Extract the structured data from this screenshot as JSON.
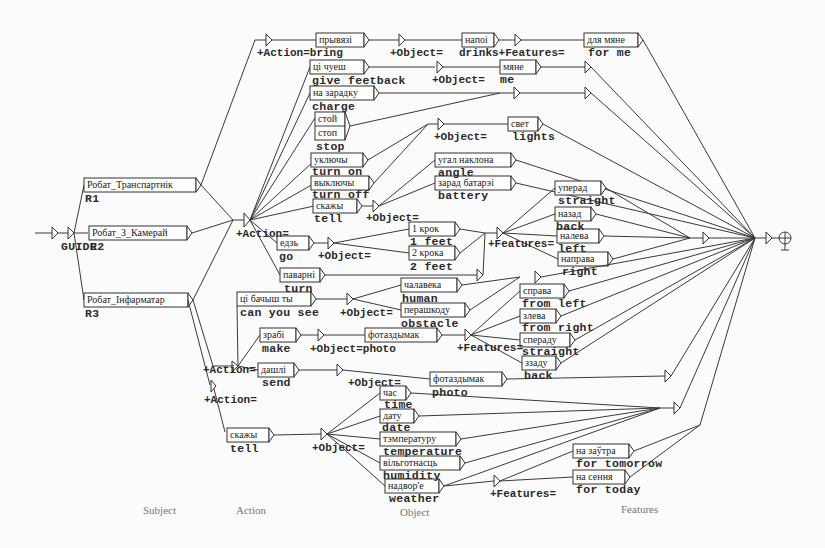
{
  "diagram": {
    "title": "",
    "start_label": "GUIDE",
    "columns": [
      "Subject",
      "Action",
      "Object",
      "Features"
    ],
    "subjects": [
      {
        "input": "Робат_Транспартнік",
        "output": "R1"
      },
      {
        "input": "Робат_З_Камерай",
        "output": "R2"
      },
      {
        "input": "Робат_Інфарматар",
        "output": "R3"
      }
    ],
    "tags": {
      "action_bring": "+Action=bring",
      "object_eq": "+Object=",
      "features_eq": "+Features=",
      "action_eq": "+Action=",
      "object_photo": "+Object=photo",
      "drinks_features": "drinks+Features="
    },
    "r1_branch": {
      "bring": {
        "input": "прывязі",
        "output": ""
      },
      "drinks": {
        "input": "напоі"
      },
      "for_me": {
        "input": "для мяне",
        "output": "for me"
      }
    },
    "r2_actions": [
      {
        "input": "ці чуеш",
        "output": "give feetback"
      },
      {
        "input": "на зарадку",
        "output": "charge"
      },
      {
        "input": "стой",
        "output": ""
      },
      {
        "input": "стоп",
        "output": "stop"
      },
      {
        "input": "уключы",
        "output": "turn on"
      },
      {
        "input": "выключы",
        "output": "turn off"
      },
      {
        "input": "скажы",
        "output": "tell"
      },
      {
        "input": "едзь",
        "output": "go"
      },
      {
        "input": "паварні",
        "output": "turn"
      }
    ],
    "r2_objects": [
      {
        "input": "мяне",
        "output": "me"
      },
      {
        "input": "свет",
        "output": "lights"
      },
      {
        "input": "угал наклона",
        "output": "angle"
      },
      {
        "input": "зарад батарэі",
        "output": "battery"
      },
      {
        "input": "1 крок",
        "output": "1 feet"
      },
      {
        "input": "2 крока",
        "output": "2 feet"
      }
    ],
    "r2_features": [
      {
        "input": "уперад",
        "output": "straight"
      },
      {
        "input": "назад",
        "output": "back"
      },
      {
        "input": "налева",
        "output": "left"
      },
      {
        "input": "направа",
        "output": "right"
      }
    ],
    "r3_see": {
      "input": "ці бачыш ты",
      "output": "can you see"
    },
    "r3_see_objects": [
      {
        "input": "чалавека",
        "output": "human"
      },
      {
        "input": "перашкоду",
        "output": "obstacle"
      }
    ],
    "r3_see_features": [
      {
        "input": "справа",
        "output": "from left"
      },
      {
        "input": "злева",
        "output": "from right"
      },
      {
        "input": "спераду",
        "output": "straight"
      },
      {
        "input": "ззаду",
        "output": "back"
      }
    ],
    "r3_make": {
      "input": "зрабі",
      "output": "make"
    },
    "r3_make_photo": {
      "input": "фотаздымак"
    },
    "r3_send": {
      "input": "дашлі",
      "output": "send"
    },
    "r3_send_photo": {
      "input": "фотаздымак",
      "output": "photo"
    },
    "r3_tell": {
      "input": "скажы",
      "output": "tell"
    },
    "r3_tell_objects": [
      {
        "input": "час",
        "output": "time"
      },
      {
        "input": "дату",
        "output": "date"
      },
      {
        "input": "тэмпературу",
        "output": "temperature"
      },
      {
        "input": "вільготнасць",
        "output": "humidity"
      },
      {
        "input": "надвор'е",
        "output": "weather"
      }
    ],
    "r3_tell_features": [
      {
        "input": "на заўтра",
        "output": "for tomorrow"
      },
      {
        "input": "на сення",
        "output": "for today"
      }
    ]
  }
}
